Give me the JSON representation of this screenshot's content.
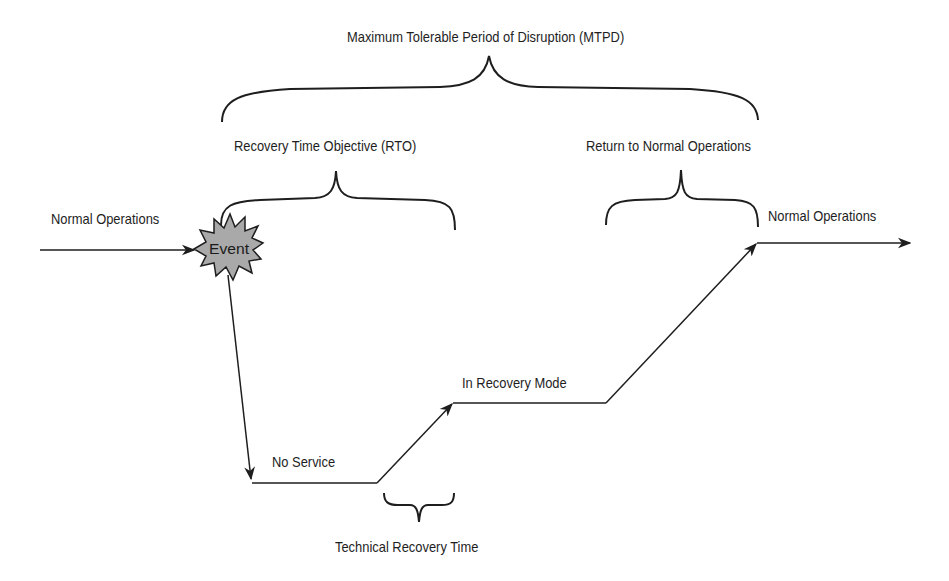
{
  "diagram": {
    "title": "Maximum Tolerable Period of Disruption (MTPD)",
    "braces": {
      "mtpd": "Maximum Tolerable Period of Disruption (MTPD)",
      "rto": "Recovery Time Objective (RTO)",
      "return": "Return to Normal Operations",
      "technical": "Technical Recovery Time"
    },
    "states": {
      "normal_before": "Normal Operations",
      "event": "Event",
      "no_service": "No Service",
      "in_recovery": "In Recovery Mode",
      "normal_after": "Normal Operations"
    },
    "colors": {
      "line": "#1e1e1e",
      "event_fill": "#a9a9a9",
      "background": "#ffffff"
    }
  }
}
